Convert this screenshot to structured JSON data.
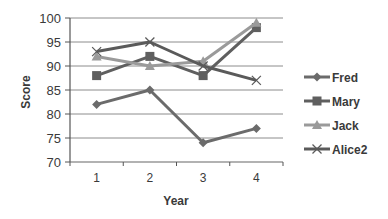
{
  "chart_data": {
    "type": "line",
    "title": "",
    "xlabel": "Year",
    "ylabel": "Score",
    "categories": [
      "1",
      "2",
      "3",
      "4"
    ],
    "ylim": [
      70,
      100
    ],
    "yticks": [
      70,
      75,
      80,
      85,
      90,
      95,
      100
    ],
    "grid": true,
    "legend_position": "right",
    "series": [
      {
        "name": "Fred",
        "values": [
          82,
          85,
          74,
          77
        ],
        "marker": "diamond",
        "color": "#6b6b6b"
      },
      {
        "name": "Mary",
        "values": [
          88,
          92,
          88,
          98
        ],
        "marker": "square",
        "color": "#5f5f5f"
      },
      {
        "name": "Jack",
        "values": [
          92,
          90,
          91,
          99
        ],
        "marker": "triangle",
        "color": "#9a9a9a"
      },
      {
        "name": "Alice2",
        "values": [
          93,
          95,
          90,
          87
        ],
        "marker": "x",
        "color": "#5a5a5a"
      }
    ]
  }
}
